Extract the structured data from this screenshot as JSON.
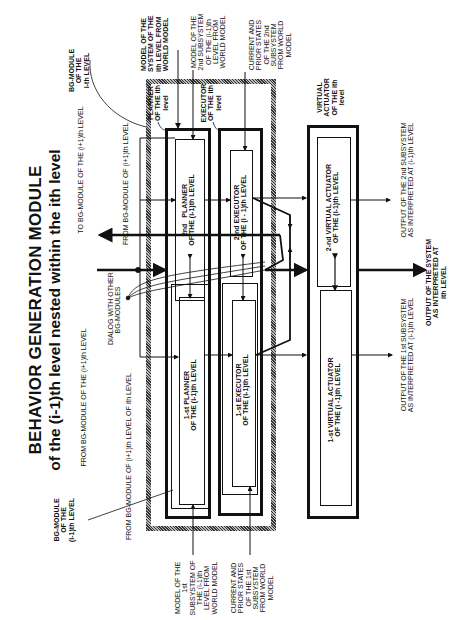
{
  "title": {
    "line1": "BEHAVIOR GENERATION MODULE",
    "line2": "of the (i-1)th level nested within the ith level"
  },
  "labels": {
    "bg_module_ith": "BG-MODULE\nOF THE\ni-th LEVEL",
    "bg_module_i_minus_1": "BG-MODULE\nOF THE\n(i-1)th LEVEL",
    "to_bg_i_plus_1": "TO BG-MODULE OF THE (i+1)th LEVEL",
    "from_bg_i_plus_1_a": "FROM BG-MODULE OF (i+1)th LEVEL",
    "from_bg_i_plus_1_b": "FROM BG-MODULE OF THE (i+1)th LEVEL",
    "from_bg_i_plus_1_c": "FROM BG-MODULE OF (i+1)th LEVEL OF ith LEVEL",
    "dialog": "DIALOG WITH OTHER\nBG-MODULES",
    "model_system_ith": "MODEL OF THE\nSYSTEM OF THE\nith LEVEL FROM\nWORLD MODEL",
    "model_2nd_subsystem": "MODEL OF THE\n2nd SUBSYSTEM\nOF THE (i-1)th\nLEVEL FROM\nWORLD MODEL",
    "current_prior_2nd": "CURRENT AND\nPRIOR STATES\nOF THE 2nd\nSUBSYSTEM\nFROM WORLD\nMODEL",
    "model_1st_subsystem": "MODEL OF THE\n1st\nSUBSYSTEM OF\nTHE (i-1)th\nLEVEL FROM\nWORLD MODEL",
    "current_prior_1st": "CURRENT AND\nPRIOR STATES\nOF THE 1st\nSUBSYSTEM\nFROM WORLD\nMODEL",
    "planner_ith": "PLANNER\nOF THE ith\nlevel",
    "executor_ith": "EXECUTOR\nOF THE ith\nlevel",
    "virtual_actuator_ith": "VIRTUAL\nACTUATOR\nOF THE ith\nlevel",
    "output_2nd": "OUTPUT OF THE 2nd SUBSYSTEM\nAS INTERPRETED AT (i-1)th LEVEL",
    "output_1st": "OUTPUT OF THE 1st SUBSYSTEM\nAS INTERPRETED AT (i-1)th LEVEL",
    "output_system": "OUTPUT OF THE SYSTEM\nAS INTERPRETED AT\nith LEVEL"
  },
  "blocks": {
    "planner_2nd": "2nd   PLANNER\nOF THE (i-1)th LEVEL",
    "planner_1st": "1-st PLANNER\nOF THE (i-1)th LEVEL",
    "executor_2nd": "2-nd EXECUTOR\nOF THE (i - 1)th LEVEL",
    "executor_1st": "1-st EXECUTOR\nOF THE (i-1)th LEVEL",
    "actuator_2nd": "2-nd VIRTUAL ACTUATOR\nOF THE (i-1)th LEVEL",
    "actuator_1st": "1-st VIRTUAL ACTUATOR\nOF THE (i -1)th LEVEL"
  }
}
